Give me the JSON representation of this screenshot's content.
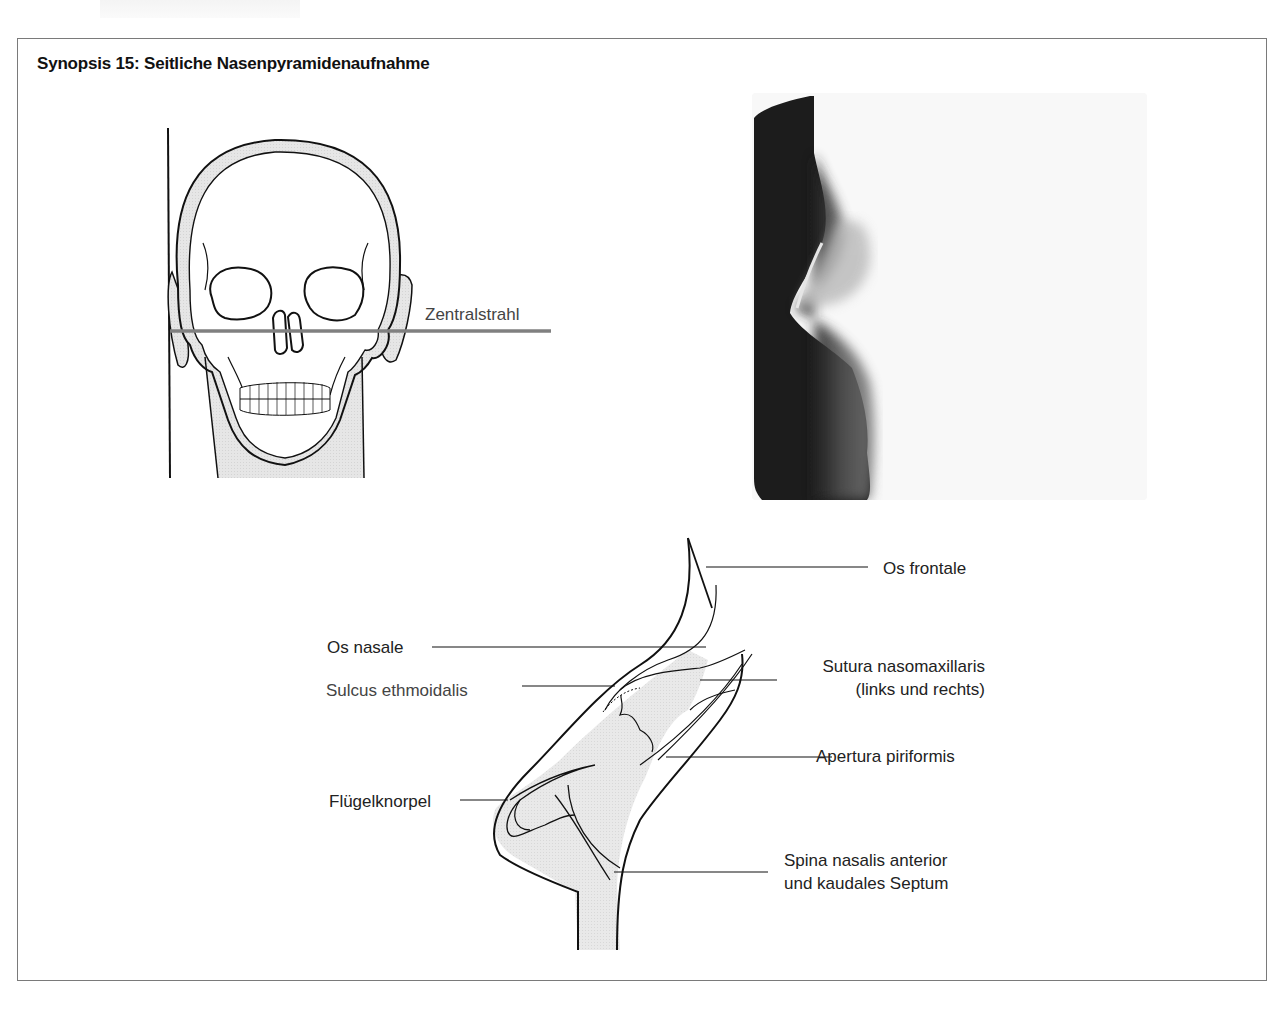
{
  "figure": {
    "title": "Synopsis 15: Seitliche Nasenpyramidenaufnahme"
  },
  "skull_diagram": {
    "beam_label": "Zentralstrahl",
    "beam_color": "#808080"
  },
  "xray_image": {
    "description": "lateral nasal bone radiograph"
  },
  "nose_diagram": {
    "labels": {
      "os_frontale": "Os frontale",
      "os_nasale": "Os nasale",
      "sulcus_ethmoidalis": "Sulcus ethmoidalis",
      "sutura_line1": "Sutura nasomaxillaris",
      "sutura_line2": "(links und rechts)",
      "apertura": "Apertura piriformis",
      "fluegelknorpel": "Flügelknorpel",
      "spina_line1": "Spina nasalis anterior",
      "spina_line2": "und kaudales Septum"
    },
    "fill_color": "#e4e4e4"
  }
}
